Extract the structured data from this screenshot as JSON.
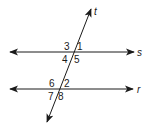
{
  "diagram": {
    "stroke_color": "#1a1a1a",
    "lines": [
      {
        "id": "s",
        "label": "s",
        "type": "parallel"
      },
      {
        "id": "r",
        "label": "r",
        "type": "parallel"
      },
      {
        "id": "t",
        "label": "t",
        "type": "transversal"
      }
    ],
    "angles_at_s": {
      "top_left": "3",
      "top_right": "1",
      "bottom_left": "4",
      "bottom_right": "5"
    },
    "angles_at_r": {
      "top_left": "6",
      "top_right": "2",
      "bottom_left": "7",
      "bottom_right": "8"
    }
  }
}
